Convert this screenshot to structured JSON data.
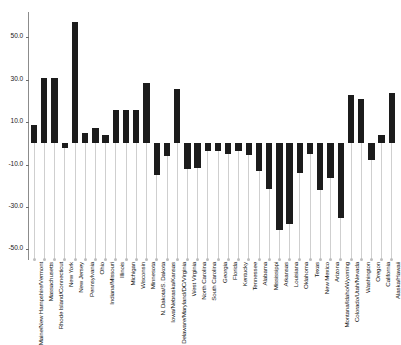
{
  "chart_data": {
    "type": "bar",
    "title": "",
    "subtitle": "",
    "xlabel": "",
    "ylabel": "",
    "ylim": [
      -55,
      62
    ],
    "grid": false,
    "legend": null,
    "yticks": [
      50.0,
      30.0,
      10.0,
      -10.0,
      -30.0,
      -50.0
    ],
    "ytick_labels": [
      "50.0",
      "30.0",
      "10.0",
      "-10.0",
      "-30.0",
      "-50.0"
    ],
    "categories": [
      "Maine/New Hampshire/Vermont",
      "Massachusetts",
      "Rhode Island/Connecticut",
      "New York",
      "New Jersey",
      "Pennsylvania",
      "Ohio",
      "Indiana/Missouri",
      "Illinois",
      "Michigan",
      "Wisconsin",
      "Minnesota",
      "N. Dakota/S. Dakota",
      "Iowa/Nebraska/Kansas",
      "Delaware/Maryland/DC/Virginia",
      "West Virginia",
      "North Carolina",
      "South Carolina",
      "Georgia",
      "Florida",
      "Kentucky",
      "Tennessee",
      "Alabama",
      "Mississippi",
      "Arkansas",
      "Louisiana",
      "Oklahoma",
      "Texas",
      "New Mexico",
      "Arizona",
      "Montana/Idaho/Wyoming",
      "Colorado/Utah/Nevada",
      "Washington",
      "Oregon",
      "California",
      "Alaska/Hawaii"
    ],
    "values": [
      8.5,
      31.0,
      31.0,
      -2.0,
      57.5,
      5.0,
      7.5,
      4.0,
      16.0,
      16.0,
      16.0,
      28.5,
      -15.0,
      -6.0,
      25.5,
      -12.0,
      -11.5,
      -3.5,
      -3.5,
      -5.0,
      -3.5,
      -5.5,
      -13.0,
      -21.5,
      -41.0,
      -38.0,
      -14.0,
      -5.0,
      -22.0,
      -16.5,
      -35.0,
      23.0,
      21.0,
      -8.0,
      4.0,
      24.0
    ]
  }
}
